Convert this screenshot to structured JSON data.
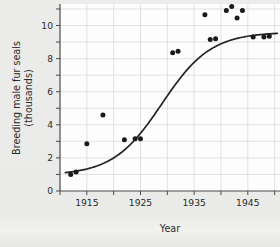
{
  "chart_data": {
    "type": "scatter",
    "title": "",
    "xlabel": "Year",
    "ylabel": "Breeding male fur seals (thousands)",
    "ylabel_line1": "Breeding male fur seals",
    "ylabel_line2": "(thousands)",
    "xlim": [
      1910,
      1951
    ],
    "ylim": [
      0,
      11.3
    ],
    "xticks": [
      1910,
      1915,
      1920,
      1925,
      1930,
      1935,
      1940,
      1945,
      1950
    ],
    "xtick_labels": [
      "",
      "1915",
      "",
      "1925",
      "",
      "1935",
      "",
      "1945",
      ""
    ],
    "yticks": [
      0,
      1,
      2,
      3,
      4,
      5,
      6,
      7,
      8,
      9,
      10,
      11
    ],
    "ytick_labels": [
      "0",
      "",
      "2",
      "",
      "4",
      "",
      "6",
      "",
      "8",
      "",
      "10",
      ""
    ],
    "grid": true,
    "legend": "none",
    "series": [
      {
        "name": "Breeding male fur seals",
        "marker": "filled-circle",
        "color": "#1a1a1a",
        "x": [
          1912,
          1913,
          1915,
          1918,
          1922,
          1924,
          1925,
          1931,
          1932,
          1937,
          1938,
          1939,
          1941,
          1942,
          1943,
          1944,
          1946,
          1948,
          1949
        ],
        "y": [
          1.0,
          1.15,
          2.85,
          4.6,
          3.1,
          3.15,
          3.15,
          8.35,
          8.45,
          10.65,
          9.15,
          9.2,
          10.9,
          11.15,
          10.45,
          10.9,
          9.3,
          9.3,
          9.35
        ]
      }
    ],
    "fit_curve": {
      "name": "logistic fit",
      "type": "logistic",
      "color": "#242424",
      "asymptote": 9.6,
      "midpoint_year": 1929,
      "growth_rate": 0.22,
      "baseline": 0.95,
      "x_start": 1911,
      "x_end": 1950.5
    }
  },
  "figure": {
    "background_color": "#eaeae8",
    "plot_background_color": "#fdfdfd",
    "grid_color": "#cfcfd4",
    "axis_color": "#4a4a4a"
  }
}
